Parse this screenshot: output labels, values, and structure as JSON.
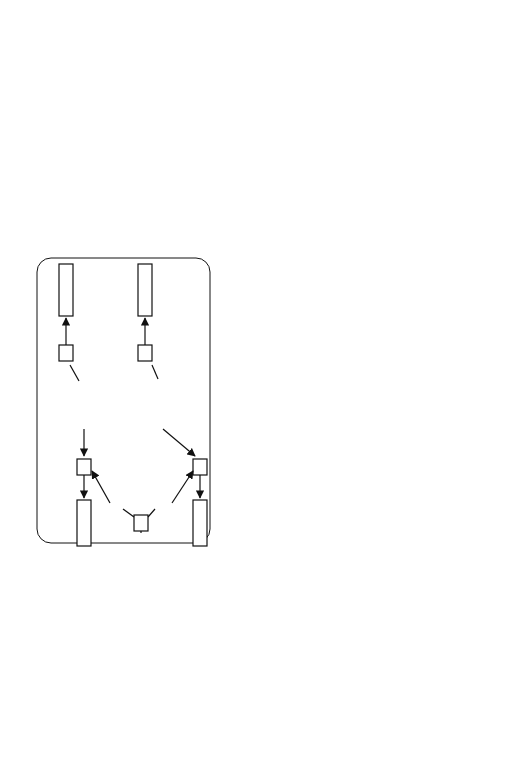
{
  "figure": {
    "analogy_criterion": {
      "caption": "analogy criterion",
      "nodes": {
        "something_x": "SOMETHING",
        "var_x": "?X",
        "material_m": "MATERIAL",
        "var_m": "?M",
        "something_y": "SOMETHING",
        "var_y": "?Y",
        "material_n": "MATERIAL",
        "var_n": "?N",
        "adhesive": "ADHESIVE",
        "var_z": "?Z"
      },
      "edges": {
        "is_x": "IS",
        "made_of_x": "MADE-OF",
        "is_y": "IS",
        "made_of_y": "MADE-OF",
        "is_m": "IS",
        "is_n": "IS",
        "glues_m": "GLUES",
        "glues_n": "GLUES",
        "is_z": "IS"
      }
    },
    "explanation": {
      "caption": "explanation",
      "nodes": {
        "paper": "PAPER",
        "membrane": "MEMBRANE1",
        "adhesive": "CONTACT-ADHESIVE1",
        "metal": "METAL",
        "chassis": "CHASSIS-ASSEMBLY1"
      },
      "edges": {
        "made_of_1": "MADE-OF",
        "glues_1": "GLUES",
        "glues_2": "GLUES",
        "made_of_2": "MADE-OF"
      }
    },
    "similar_explanation": {
      "caption": "similar explanation",
      "nodes": {
        "metal_1": "METAL",
        "screening_cap": "SCREENING-CAP1",
        "scotch_tape": "SCOTCH-TAPE1",
        "metal_2": "METAL",
        "loudspeaker": "LOUDSPEAKER1"
      },
      "edges": {
        "made_of_1": "MADE-OF",
        "glues_1": "GLUES",
        "glues_2": "GLUES",
        "made_of_2": "MADE-OF"
      }
    },
    "initial_example": {
      "caption": "initial example",
      "lines": [
        "IF the task is",
        "   ATTACH OBJECT MEMBRANE1 TO CHASSIS-ASSEMBLY1",
        "THEN decompose this task into the subtasks",
        "    APPLY OBJECT CONTACT-ADHESIVE1 ON MEMBRANE1",
        "    PRESS OBJECT MEMBRANE1 ON CHASSIS-ASSEMBLY1"
      ]
    },
    "additional_explanation": {
      "caption": "additional explanation",
      "text": "CONTACT-ADHESIVE1 STATE fluid"
    },
    "generated_example": {
      "caption": "generated example",
      "status": "rejected",
      "lines": [
        "IF the task is",
        "   ATTACH OBJECT SCREENING-CAP1 TO LOUDSPEAKER1",
        "THEN decompose this task into the subtasks",
        "    APPLY OBJECT SCOTCH-TAPE1 ON SCREENING-CAP1",
        "    PRESS OBJECT SCREENING-CAP1 ON LOUDSPEAKER1"
      ]
    },
    "failure_explanation": {
      "caption": "failure explanation",
      "text": "SCOTCH-TAPE1 STATE solid"
    },
    "colors": {
      "line": "#111111",
      "background": "#ffffff",
      "caption": "#222222"
    }
  }
}
